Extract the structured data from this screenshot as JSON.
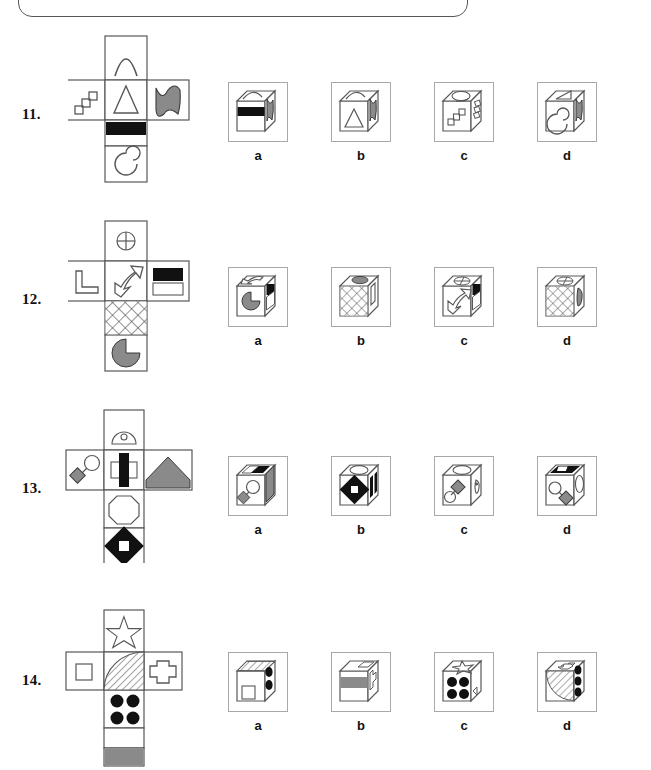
{
  "page": {
    "background": "#ffffff",
    "line_color": "#58585a",
    "gray_fill": "#8a8a8a",
    "black_fill": "#111111"
  },
  "top_frame": {
    "name": "rounded-panel-bottom-edge",
    "visible": true
  },
  "questions": [
    {
      "number": "11.",
      "net": {
        "name": "cube-net-11",
        "faces": [
          {
            "position": "top",
            "icon": "arch-outline"
          },
          {
            "position": "left",
            "icon": "staircase-steps-outline"
          },
          {
            "position": "center",
            "icon": "triangle-outline"
          },
          {
            "position": "right",
            "icon": "gray-wavy-blob"
          },
          {
            "position": "below-center",
            "icon": "black-horizontal-band"
          },
          {
            "position": "bottom",
            "icon": "spiral-outline"
          }
        ]
      },
      "options": [
        {
          "label": "a",
          "faces": {
            "top": "arch-outline",
            "front": "black-horizontal-band",
            "side": "gray-wavy-blob"
          }
        },
        {
          "label": "b",
          "faces": {
            "top": "arch-outline",
            "front": "triangle-outline",
            "side": "gray-wavy-blob"
          }
        },
        {
          "label": "c",
          "faces": {
            "top": "spiral-outline",
            "front": "staircase-steps-outline",
            "side": "staircase-steps-outline"
          }
        },
        {
          "label": "d",
          "faces": {
            "top": "triangle-outline",
            "front": "spiral-outline",
            "side": "gray-wavy-blob"
          }
        }
      ]
    },
    {
      "number": "12.",
      "net": {
        "name": "cube-net-12",
        "faces": [
          {
            "position": "top",
            "icon": "crossed-circle-outline"
          },
          {
            "position": "left",
            "icon": "l-shape-outline"
          },
          {
            "position": "center",
            "icon": "double-headed-curved-arrow"
          },
          {
            "position": "right",
            "icon": "black-and-white-bars"
          },
          {
            "position": "below-center",
            "icon": "crosshatch-mesh"
          },
          {
            "position": "bottom",
            "icon": "gray-pacman-circle"
          }
        ]
      },
      "options": [
        {
          "label": "a",
          "faces": {
            "top": "double-headed-curved-arrow",
            "front": "gray-pacman-circle",
            "side": "black-and-white-bars"
          }
        },
        {
          "label": "b",
          "faces": {
            "top": "gray-pacman-circle",
            "front": "crosshatch-mesh",
            "side": "l-shape-outline"
          }
        },
        {
          "label": "c",
          "faces": {
            "top": "crossed-circle-outline",
            "front": "double-headed-curved-arrow",
            "side": "black-and-white-bars"
          }
        },
        {
          "label": "d",
          "faces": {
            "top": "crossed-circle-outline",
            "front": "crosshatch-mesh",
            "side": "gray-pacman-circle"
          }
        }
      ]
    },
    {
      "number": "13.",
      "net": {
        "name": "cube-net-13",
        "faces": [
          {
            "position": "top",
            "icon": "dome-with-small-circle"
          },
          {
            "position": "left",
            "icon": "gray-diamond-with-circle-on-stick"
          },
          {
            "position": "center",
            "icon": "black-bar-over-white-rectangle"
          },
          {
            "position": "right",
            "icon": "gray-house-pentagon"
          },
          {
            "position": "below-center",
            "icon": "octagon-outline"
          },
          {
            "position": "bottom",
            "icon": "black-diamond-with-white-square"
          }
        ]
      },
      "options": [
        {
          "label": "a",
          "faces": {
            "top": "black-bar-over-white-rectangle",
            "front": "gray-diamond-with-circle-on-stick",
            "side": "gray-house-pentagon"
          }
        },
        {
          "label": "b",
          "faces": {
            "top": "dome-with-small-circle",
            "front": "black-diamond-with-white-square",
            "side": "black-bar-over-white-rectangle"
          }
        },
        {
          "label": "c",
          "faces": {
            "top": "dome-with-small-circle",
            "front": "gray-diamond-with-circle-on-stick",
            "side": "dome-with-small-circle"
          }
        },
        {
          "label": "d",
          "faces": {
            "top": "black-bar-over-white-rectangle",
            "front": "gray-diamond-with-circle-on-stick",
            "side": "octagon-outline"
          }
        }
      ]
    },
    {
      "number": "14.",
      "net": {
        "name": "cube-net-14",
        "faces": [
          {
            "position": "top",
            "icon": "star-outline"
          },
          {
            "position": "left",
            "icon": "small-square-outline"
          },
          {
            "position": "center",
            "icon": "hatched-quarter-circle"
          },
          {
            "position": "right",
            "icon": "plus-cross-outline"
          },
          {
            "position": "below-center",
            "icon": "four-black-dots"
          },
          {
            "position": "bottom",
            "icon": "gray-block"
          }
        ]
      },
      "options": [
        {
          "label": "a",
          "faces": {
            "top": "hatched-quarter-circle",
            "front": "small-square-outline",
            "side": "four-black-dots"
          }
        },
        {
          "label": "b",
          "faces": {
            "top": "small-square-outline",
            "front": "gray-block",
            "side": "plus-cross-outline"
          }
        },
        {
          "label": "c",
          "faces": {
            "top": "star-outline",
            "front": "four-black-dots",
            "side": "blank"
          }
        },
        {
          "label": "d",
          "faces": {
            "top": "plus-cross-outline",
            "front": "hatched-quarter-circle",
            "side": "four-black-dots"
          }
        }
      ]
    }
  ],
  "option_labels": [
    "a",
    "b",
    "c",
    "d"
  ]
}
